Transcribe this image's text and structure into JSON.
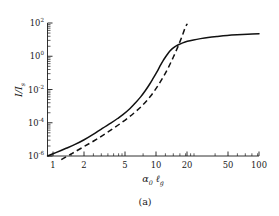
{
  "figure": {
    "caption": "(a)",
    "background_color": "#ffffff",
    "ink_color": "#111111"
  },
  "chart_data": {
    "type": "line",
    "title": "",
    "subtitle": "",
    "xlabel": "α₀ ℓ_g",
    "ylabel": "I/I_s",
    "xscale": "log",
    "yscale": "log",
    "xlim": [
      1,
      100
    ],
    "ylim": [
      1e-06,
      100
    ],
    "grid": false,
    "legend": "none",
    "frame": "left-bottom-only",
    "xlabel_parts": {
      "base1": "α",
      "sub1": "0",
      "base2": "ℓ",
      "sub2": "g"
    },
    "ylabel_parts": {
      "num": "I",
      "slash": "/",
      "den": "I",
      "den_sub": "s"
    },
    "xticks": [
      1,
      2,
      5,
      10,
      20,
      50,
      100
    ],
    "xtick_labels": [
      "1",
      "2",
      "5",
      "10",
      "20",
      "50",
      "100"
    ],
    "yticks": [
      1e-06,
      0.0001,
      0.01,
      1,
      100
    ],
    "ytick_labels": [
      "10",
      "10",
      "10",
      "10",
      "10"
    ],
    "ytick_exponents": [
      "-6",
      "-4",
      "-2",
      "0",
      "2"
    ],
    "series": [
      {
        "name": "full solution",
        "style": "solid",
        "x": [
          1.0,
          1.2,
          1.5,
          1.8,
          2.2,
          2.7,
          3.3,
          4.0,
          4.6,
          5.2,
          6.0,
          6.8,
          7.6,
          8.4,
          9.2,
          10.0,
          10.8,
          11.6,
          12.4,
          13.2,
          14.0,
          14.8,
          15.6,
          16.5,
          17.5,
          19.0,
          21.0,
          24.0,
          28.0,
          33.0,
          40.0,
          50.0,
          62.0,
          78.0,
          100.0
        ],
        "y": [
          1e-06,
          1.6e-06,
          2.9e-06,
          4.8e-06,
          9.2e-06,
          2e-05,
          4.6e-05,
          9.8e-05,
          0.00018,
          0.00032,
          0.0007,
          0.0016,
          0.0036,
          0.0084,
          0.02,
          0.048,
          0.11,
          0.26,
          0.55,
          1.0,
          1.7,
          2.5,
          3.3,
          4.2,
          5.1,
          6.4,
          7.9,
          9.6,
          11.5,
          13.5,
          15.5,
          17.8,
          19.5,
          21.0,
          22.5
        ]
      },
      {
        "name": "asymptote",
        "style": "dashed",
        "x": [
          1.35,
          1.7,
          2.2,
          2.9,
          3.8,
          5.0,
          6.5,
          8.0,
          9.5,
          11.0,
          12.5,
          14.0,
          15.5,
          17.0,
          18.5,
          20.0,
          21.0
        ],
        "y": [
          6e-07,
          1.4e-06,
          3.6e-06,
          1e-05,
          3e-05,
          0.0001,
          0.00036,
          0.0012,
          0.0042,
          0.016,
          0.06,
          0.23,
          0.9,
          3.4,
          13.0,
          50.0,
          90.0
        ]
      }
    ]
  }
}
